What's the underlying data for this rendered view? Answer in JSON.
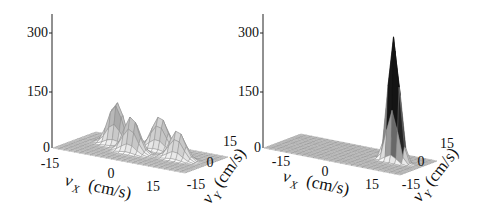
{
  "chart_data": [
    {
      "type": "surface3d",
      "title": "",
      "xlabel": "v_X (cm/s)",
      "ylabel": "v_Y (cm/s)",
      "zlabel": "",
      "x_ticks": [
        "-15",
        "0",
        "15"
      ],
      "y_ticks": [
        "-15",
        "0",
        "15"
      ],
      "z_ticks": [
        "0",
        "150",
        "300"
      ],
      "xlim": [
        -20,
        20
      ],
      "ylim": [
        -20,
        20
      ],
      "zlim": [
        0,
        350
      ],
      "grid_resolution": 25,
      "peaks": [
        {
          "vx": -9,
          "vy": 5,
          "height": 115,
          "width": 2.2
        },
        {
          "vx": 3,
          "vy": 9,
          "height": 90,
          "width": 2.4
        },
        {
          "vx": -2,
          "vy": -2,
          "height": 95,
          "width": 2.2
        },
        {
          "vx": 11,
          "vy": 1,
          "height": 75,
          "width": 2.2
        }
      ],
      "description": "Four distinct peaks of roughly 75-115 height in velocity space"
    },
    {
      "type": "surface3d",
      "title": "",
      "xlabel": "v_X (cm/s)",
      "ylabel": "v_Y (cm/s)",
      "zlabel": "",
      "x_ticks": [
        "-15",
        "0",
        "15"
      ],
      "y_ticks": [
        "-15",
        "0",
        "15"
      ],
      "z_ticks": [
        "0",
        "150",
        "300"
      ],
      "xlim": [
        -20,
        20
      ],
      "ylim": [
        -20,
        20
      ],
      "zlim": [
        0,
        350
      ],
      "grid_resolution": 25,
      "peaks": [
        {
          "vx": 12,
          "vy": 3,
          "height": 350,
          "width": 1.6
        }
      ],
      "description": "Single sharp peak exceeding 300 near vx=12, vy=3"
    }
  ],
  "plots": [
    {
      "z_ticks": [
        "300",
        "150",
        "0"
      ],
      "x_label_main": "v",
      "x_label_sub": "X",
      "x_label_unit": "(cm/s)",
      "y_label_main": "v",
      "y_label_sub": "Y",
      "y_label_unit": "(cm/s)",
      "x_ticks": [
        "-15",
        "0",
        "15"
      ],
      "y_ticks": [
        "15",
        "0",
        "-15"
      ]
    },
    {
      "z_ticks": [
        "300",
        "150",
        "0"
      ],
      "x_label_main": "v",
      "x_label_sub": "X",
      "x_label_unit": "(cm/s)",
      "y_label_main": "v",
      "y_label_sub": "Y",
      "y_label_unit": "(cm/s)",
      "x_ticks": [
        "-15",
        "0",
        "15"
      ],
      "y_ticks": [
        "15",
        "0",
        "-15"
      ]
    }
  ]
}
